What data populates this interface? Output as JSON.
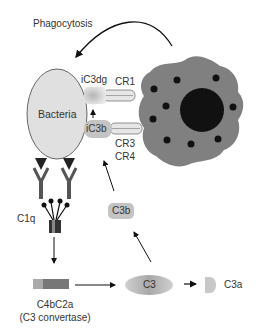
{
  "title": "Phagocytosis",
  "labels": {
    "bacteria": "Bacteria",
    "ic3dg": "iC3dg",
    "ic3b": "iC3b",
    "cr1": "CR1",
    "cr3": "CR3",
    "cr4": "CR4",
    "c1q": "C1q",
    "c3b": "C3b",
    "c3": "C3",
    "c3a": "C3a",
    "c4bc2a": "C4bC2a",
    "c3_convertase": "(C3 convertase)"
  },
  "colors": {
    "bacteria_fill": "#e0e0e0",
    "phagocyte_fill": "#808080",
    "nucleus_fill": "#111111",
    "granule_fill": "#111111",
    "fragment_fill": "#bdbdbd",
    "arrow": "#111111"
  }
}
